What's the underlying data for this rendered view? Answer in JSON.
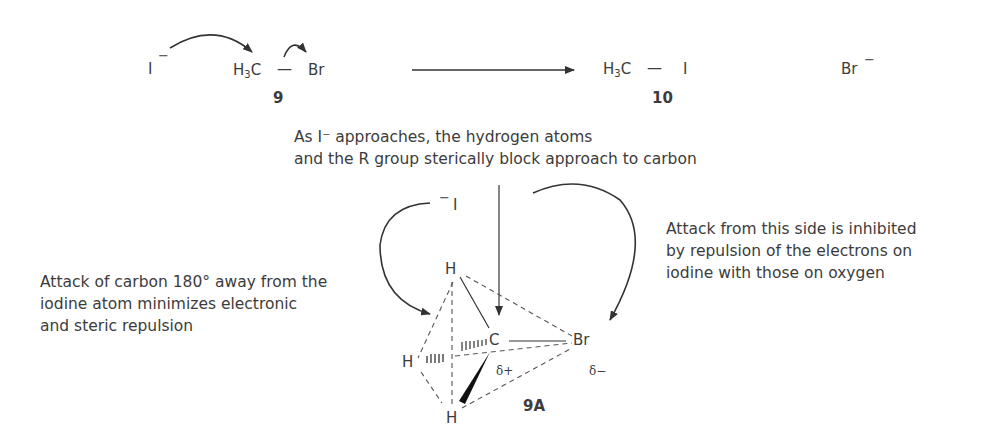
{
  "reaction": {
    "nucleophile": "I",
    "nucleophile_charge": "−",
    "reactant_left": "H",
    "reactant_sub": "3",
    "reactant_c": "C",
    "reactant_bond": "—",
    "leaving_group": "Br",
    "reactant_label": "9",
    "product_left": "H",
    "product_sub": "3",
    "product_c": "C",
    "product_bond": "—",
    "product_right": "I",
    "product_label": "10",
    "byproduct": "Br",
    "byproduct_charge": "−"
  },
  "annotations": {
    "top_line1": "As I⁻ approaches, the hydrogen atoms",
    "top_line2": "and the R group sterically block approach to carbon",
    "left_line1": "Attack of carbon 180° away from the",
    "left_line2": "iodine atom minimizes electronic",
    "left_line3": "and steric repulsion",
    "right_line1": "Attack from this side is inhibited",
    "right_line2": "by repulsion of the electrons on",
    "right_line3": "iodine with those on oxygen"
  },
  "structure_9A": {
    "iodide_charge": "−",
    "iodide": "I",
    "h_top": "H",
    "h_left": "H",
    "h_bottom": "H",
    "carbon": "C",
    "bromine": "Br",
    "delta_plus": "δ+",
    "delta_minus": "δ−",
    "label": "9A"
  }
}
